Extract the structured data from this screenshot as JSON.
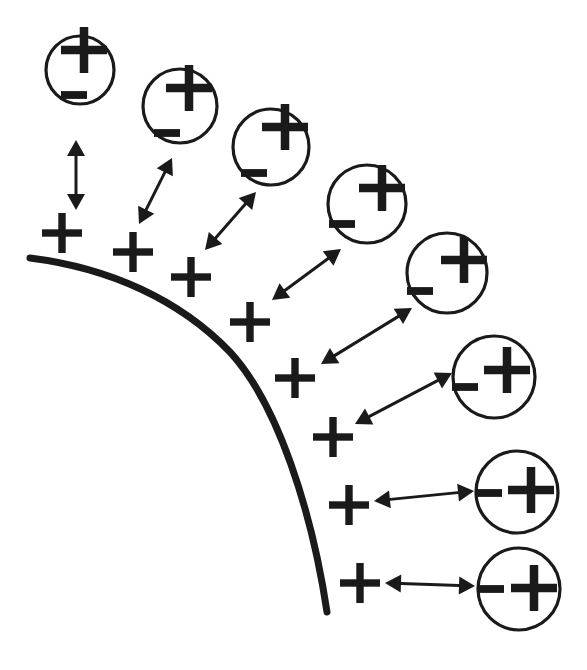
{
  "figure": {
    "type": "diagram",
    "background_color": "#ffffff",
    "ink_color": "#1a1a1a",
    "width": 587,
    "height": 670,
    "plus_glyph": "+",
    "minus_glyph": "−"
  },
  "surface": {
    "label": "curved-charged-surface",
    "stroke_color": "#1a1a1a",
    "stroke_width": 7,
    "path": "M 30 258 C 110 268 180 300 230 352 C 278 404 312 512 327 612",
    "start_point": [
      30,
      258
    ],
    "end_point": [
      327,
      612
    ]
  },
  "surface_charges": [
    {
      "id": "surface-charge-1",
      "sign": "+",
      "x": 62,
      "y": 233,
      "size": 40
    },
    {
      "id": "surface-charge-2",
      "sign": "+",
      "x": 133,
      "y": 252,
      "size": 40
    },
    {
      "id": "surface-charge-3",
      "sign": "+",
      "x": 191,
      "y": 277,
      "size": 40
    },
    {
      "id": "surface-charge-4",
      "sign": "+",
      "x": 250,
      "y": 322,
      "size": 40
    },
    {
      "id": "surface-charge-5",
      "sign": "+",
      "x": 295,
      "y": 378,
      "size": 40
    },
    {
      "id": "surface-charge-6",
      "sign": "+",
      "x": 333,
      "y": 437,
      "size": 40
    },
    {
      "id": "surface-charge-7",
      "sign": "+",
      "x": 349,
      "y": 505,
      "size": 40
    },
    {
      "id": "surface-charge-8",
      "sign": "+",
      "x": 360,
      "y": 583,
      "size": 40
    }
  ],
  "dipoles": [
    {
      "id": "dipole-1",
      "cx": 80,
      "cy": 70,
      "r": 34,
      "angle_deg": 0,
      "plus": {
        "x": 84,
        "y": 50,
        "size": 46
      },
      "minus": {
        "x": 74,
        "y": 95,
        "size": 26
      }
    },
    {
      "id": "dipole-2",
      "cx": 180,
      "cy": 106,
      "r": 37,
      "plus": {
        "x": 189,
        "y": 88,
        "size": 46
      },
      "minus": {
        "x": 167,
        "y": 133,
        "size": 26
      }
    },
    {
      "id": "dipole-3",
      "cx": 271,
      "cy": 147,
      "r": 38,
      "plus": {
        "x": 285,
        "y": 127,
        "size": 46
      },
      "minus": {
        "x": 254,
        "y": 173,
        "size": 26
      }
    },
    {
      "id": "dipole-4",
      "cx": 367,
      "cy": 204,
      "r": 39,
      "plus": {
        "x": 382,
        "y": 188,
        "size": 46
      },
      "minus": {
        "x": 342,
        "y": 224,
        "size": 26
      }
    },
    {
      "id": "dipole-5",
      "cx": 447,
      "cy": 273,
      "r": 40,
      "plus": {
        "x": 464,
        "y": 260,
        "size": 46
      },
      "minus": {
        "x": 420,
        "y": 291,
        "size": 26
      }
    },
    {
      "id": "dipole-6",
      "cx": 494,
      "cy": 377,
      "r": 41,
      "plus": {
        "x": 507,
        "y": 370,
        "size": 46
      },
      "minus": {
        "x": 465,
        "y": 387,
        "size": 26
      }
    },
    {
      "id": "dipole-7",
      "cx": 517,
      "cy": 492,
      "r": 41,
      "plus": {
        "x": 531,
        "y": 490,
        "size": 46
      },
      "minus": {
        "x": 489,
        "y": 493,
        "size": 26
      }
    },
    {
      "id": "dipole-8",
      "cx": 519,
      "cy": 589,
      "r": 41,
      "plus": {
        "x": 534,
        "y": 588,
        "size": 46
      },
      "minus": {
        "x": 491,
        "y": 589,
        "size": 26
      }
    }
  ],
  "arrows": [
    {
      "id": "arrow-1",
      "x1": 76,
      "y1": 210,
      "x2": 76,
      "y2": 140
    },
    {
      "id": "arrow-2",
      "x1": 139,
      "y1": 224,
      "x2": 172,
      "y2": 158
    },
    {
      "id": "arrow-3",
      "x1": 205,
      "y1": 250,
      "x2": 256,
      "y2": 192
    },
    {
      "id": "arrow-4",
      "x1": 272,
      "y1": 300,
      "x2": 341,
      "y2": 249
    },
    {
      "id": "arrow-5",
      "x1": 321,
      "y1": 364,
      "x2": 412,
      "y2": 308
    },
    {
      "id": "arrow-6",
      "x1": 355,
      "y1": 424,
      "x2": 452,
      "y2": 373
    },
    {
      "id": "arrow-7",
      "x1": 374,
      "y1": 501,
      "x2": 474,
      "y2": 491
    },
    {
      "id": "arrow-8",
      "x1": 385,
      "y1": 583,
      "x2": 475,
      "y2": 586
    }
  ],
  "arrow_style": {
    "stroke_color": "#1a1a1a",
    "stroke_width": 3,
    "head_length": 16,
    "head_width": 9,
    "double_headed": true
  }
}
